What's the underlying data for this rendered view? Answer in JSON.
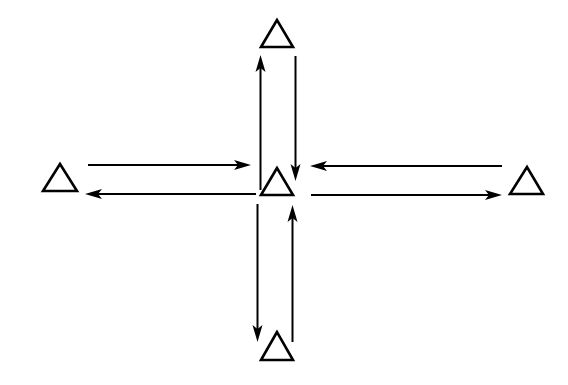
{
  "diagram": {
    "type": "network-topology",
    "colors": {
      "stroke": "#000000",
      "background": "#ffffff"
    },
    "nodes": [
      {
        "id": "top",
        "shape": "triangle",
        "position": "top"
      },
      {
        "id": "left",
        "shape": "triangle",
        "position": "left"
      },
      {
        "id": "center",
        "shape": "triangle",
        "position": "center"
      },
      {
        "id": "right",
        "shape": "triangle",
        "position": "right"
      },
      {
        "id": "bottom",
        "shape": "triangle",
        "position": "bottom"
      }
    ],
    "edges": [
      {
        "from": "center",
        "to": "top",
        "direction": "up"
      },
      {
        "from": "top",
        "to": "center",
        "direction": "down"
      },
      {
        "from": "left",
        "to": "center",
        "direction": "right"
      },
      {
        "from": "center",
        "to": "left",
        "direction": "left"
      },
      {
        "from": "right",
        "to": "center",
        "direction": "left"
      },
      {
        "from": "center",
        "to": "right",
        "direction": "right"
      },
      {
        "from": "center",
        "to": "bottom",
        "direction": "down"
      },
      {
        "from": "bottom",
        "to": "center",
        "direction": "up"
      }
    ]
  }
}
